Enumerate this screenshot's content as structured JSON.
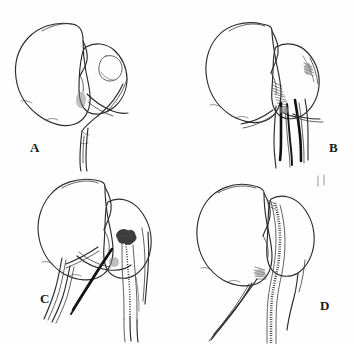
{
  "figure": {
    "type": "medical-line-drawing",
    "title": "",
    "background_color": "#fefefe",
    "ink_color": "#2b2b2b",
    "panel_count": 4,
    "panels": [
      {
        "id": "a",
        "label": "A",
        "caption": "",
        "depicts": "organ with intact hilar vessels, outline only",
        "features": [
          "organ-body-outline",
          "hilum-lobe",
          "circular-marking",
          "vascular-pedicle",
          "ureter"
        ]
      },
      {
        "id": "b",
        "label": "B",
        "caption": "",
        "depicts": "organ with vessels isolated and encircled by ties, vessel shafts darkened",
        "features": [
          "organ-body-outline",
          "hilum-lobe",
          "hatched-hilum",
          "darkened-vessels",
          "encircling-ties"
        ]
      },
      {
        "id": "c",
        "label": "C",
        "caption": "",
        "depicts": "vessel ligated with knot, suture line running along divided pedicle",
        "features": [
          "organ-body-outline",
          "hilum-lobe",
          "ligature-knot",
          "suture-line",
          "ligature-tails",
          "darkened-vessel"
        ]
      },
      {
        "id": "d",
        "label": "D",
        "caption": "",
        "depicts": "completed repair with continuous suture line along organ border",
        "features": [
          "organ-body-outline",
          "hilum-lobe",
          "continuous-suture-line",
          "hatched-hilum",
          "residual-vessels"
        ]
      }
    ]
  }
}
